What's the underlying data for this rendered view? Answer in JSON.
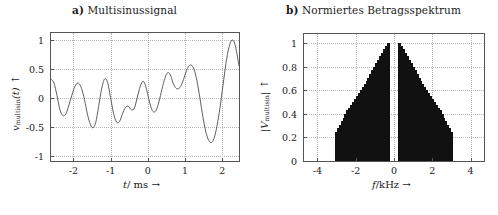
{
  "figure": {
    "panels": [
      {
        "id": "a",
        "tag": "a)",
        "title": "Multisinussignal",
        "xlabel_main": "t",
        "xlabel_unit": "/ ms",
        "xlabel_arrow": "→",
        "ylabel_main": "v",
        "ylabel_sub": "multisin",
        "ylabel_arg": "(t)",
        "ylabel_arrow": "↑",
        "xticks": [
          "-2",
          "-1",
          "0",
          "1",
          "2"
        ],
        "yticks": [
          "1",
          "0.5",
          "0",
          "-0.5",
          "-1"
        ]
      },
      {
        "id": "b",
        "tag": "b)",
        "title": "Normiertes Betragsspektrum",
        "xlabel_main": "f",
        "xlabel_unit": "/kHz",
        "xlabel_arrow": "→",
        "ylabel_main": "|V",
        "ylabel_sub": "multisin",
        "ylabel_arg": "|",
        "ylabel_arrow": "↑",
        "xticks": [
          "-4",
          "-2",
          "0",
          "2",
          "4"
        ],
        "yticks": [
          "1",
          "0.8",
          "0.6",
          "0.4",
          "0.2",
          "0"
        ]
      }
    ],
    "colors": {
      "trace": "#4d4d4d",
      "bar": "#111111",
      "grid": "#b8b8b8",
      "axis": "#555555",
      "background": "#ffffff"
    }
  },
  "chart_data": [
    {
      "type": "line",
      "panel": "a",
      "title": "a) Multisinussignal",
      "xlabel": "t/ ms →",
      "ylabel": "v_multisin(t) ↑",
      "xlim": [
        -2.6,
        2.45
      ],
      "ylim": [
        -1.08,
        1.12
      ],
      "xticks": [
        -2,
        -1,
        0,
        1,
        2
      ],
      "yticks": [
        -1,
        -0.5,
        0,
        0.5,
        1
      ],
      "grid": true,
      "x": [
        -2.6,
        -2.52,
        -2.44,
        -2.36,
        -2.28,
        -2.2,
        -2.12,
        -2.04,
        -1.96,
        -1.88,
        -1.8,
        -1.72,
        -1.64,
        -1.56,
        -1.48,
        -1.4,
        -1.32,
        -1.24,
        -1.16,
        -1.08,
        -1.0,
        -0.92,
        -0.84,
        -0.76,
        -0.68,
        -0.6,
        -0.52,
        -0.44,
        -0.36,
        -0.28,
        -0.2,
        -0.12,
        -0.04,
        0.04,
        0.12,
        0.2,
        0.28,
        0.36,
        0.44,
        0.52,
        0.6,
        0.68,
        0.76,
        0.84,
        0.92,
        1.0,
        1.08,
        1.16,
        1.24,
        1.32,
        1.4,
        1.48,
        1.56,
        1.64,
        1.72,
        1.8,
        1.88,
        1.96,
        2.04,
        2.12,
        2.2,
        2.28,
        2.36,
        2.45
      ],
      "y": [
        0.33,
        0.26,
        0.05,
        -0.2,
        -0.3,
        -0.27,
        -0.12,
        0.05,
        0.2,
        0.26,
        0.2,
        0.03,
        -0.22,
        -0.42,
        -0.51,
        -0.42,
        -0.14,
        0.16,
        0.33,
        0.27,
        0.01,
        -0.26,
        -0.41,
        -0.4,
        -0.27,
        -0.16,
        -0.14,
        -0.2,
        -0.17,
        0.02,
        0.21,
        0.29,
        0.17,
        -0.05,
        -0.21,
        -0.23,
        -0.11,
        0.1,
        0.3,
        0.43,
        0.41,
        0.26,
        0.17,
        0.17,
        0.25,
        0.4,
        0.53,
        0.57,
        0.5,
        0.3,
        0.0,
        -0.32,
        -0.58,
        -0.73,
        -0.76,
        -0.65,
        -0.4,
        -0.07,
        0.32,
        0.68,
        0.92,
        1.0,
        0.88,
        0.55
      ],
      "note": "normalized multisine time signal, amplitude range -1..1"
    },
    {
      "type": "bar",
      "panel": "b",
      "title": "b) Normiertes Betragsspektrum",
      "xlabel": "f/kHz →",
      "ylabel": "|V_multisin| ↑",
      "xlim": [
        -4.7,
        4.7
      ],
      "ylim": [
        0,
        1.08
      ],
      "xticks": [
        -4,
        -2,
        0,
        2,
        4
      ],
      "yticks": [
        0,
        0.2,
        0.4,
        0.6,
        0.8,
        1.0
      ],
      "grid": true,
      "bar_width_khz": 0.085,
      "categories": [
        -3.0,
        -2.9,
        -2.8,
        -2.7,
        -2.6,
        -2.5,
        -2.4,
        -2.3,
        -2.2,
        -2.1,
        -2.0,
        -1.9,
        -1.8,
        -1.7,
        -1.6,
        -1.5,
        -1.4,
        -1.3,
        -1.2,
        -1.1,
        -1.0,
        -0.9,
        -0.8,
        -0.7,
        -0.6,
        -0.5,
        -0.4,
        -0.3,
        0.3,
        0.4,
        0.5,
        0.6,
        0.7,
        0.8,
        0.9,
        1.0,
        1.1,
        1.2,
        1.3,
        1.4,
        1.5,
        1.6,
        1.7,
        1.8,
        1.9,
        2.0,
        2.1,
        2.2,
        2.3,
        2.4,
        2.5,
        2.6,
        2.7,
        2.8,
        2.9,
        3.0
      ],
      "values": [
        0.25,
        0.28,
        0.31,
        0.34,
        0.37,
        0.4,
        0.43,
        0.455,
        0.48,
        0.505,
        0.53,
        0.555,
        0.58,
        0.605,
        0.63,
        0.655,
        0.68,
        0.71,
        0.74,
        0.77,
        0.8,
        0.83,
        0.86,
        0.89,
        0.92,
        0.95,
        0.975,
        1.0,
        1.0,
        0.975,
        0.95,
        0.92,
        0.89,
        0.86,
        0.83,
        0.8,
        0.77,
        0.74,
        0.71,
        0.68,
        0.655,
        0.63,
        0.605,
        0.58,
        0.555,
        0.53,
        0.505,
        0.48,
        0.455,
        0.43,
        0.4,
        0.37,
        0.34,
        0.31,
        0.28,
        0.25
      ],
      "note": "normalized magnitude spectrum, symmetric triangular envelope peaking at |f| = 0.3 kHz, gap around DC"
    }
  ]
}
